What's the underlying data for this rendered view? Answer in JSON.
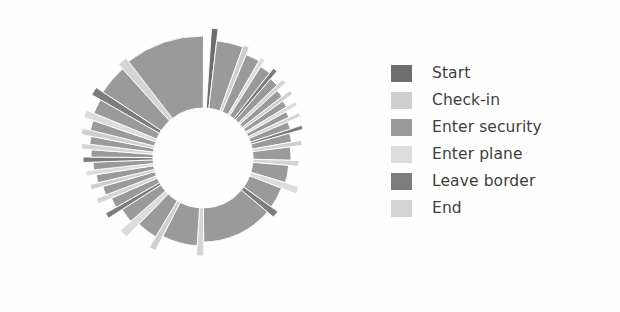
{
  "figure": {
    "background_color": "#fefefe",
    "title": ""
  },
  "legend": {
    "position": "right",
    "text_color": "#3f3f3f",
    "items": [
      {
        "label": "Start",
        "color": "#6e6e6e"
      },
      {
        "label": "Check-in",
        "color": "#cfcfcf"
      },
      {
        "label": "Enter security",
        "color": "#9a9a9a"
      },
      {
        "label": "Enter plane",
        "color": "#dcdcdc"
      },
      {
        "label": "Leave border",
        "color": "#7c7c7c"
      },
      {
        "label": "End",
        "color": "#d4d4d4"
      }
    ]
  },
  "chart_data": {
    "type": "pie",
    "subtype": "donut-radial-bar",
    "title": "",
    "xlabel": "",
    "ylabel": "",
    "grid": false,
    "legend_position": "right",
    "center_x": 203,
    "center_y": 158,
    "inner_radius": 50,
    "radius_range": [
      70,
      132
    ],
    "start_angle_deg": -88,
    "gap_deg": 3.5,
    "categories": [
      "Start",
      "Check-in",
      "Enter security",
      "Enter plane",
      "Leave border",
      "End"
    ],
    "category_colors": [
      "#6e6e6e",
      "#cfcfcf",
      "#9a9a9a",
      "#dcdcdc",
      "#7c7c7c",
      "#d4d4d4"
    ],
    "segments": [
      {
        "category": "Start",
        "angle_deg": 2.0,
        "radius": 130
      },
      {
        "category": "Enter security",
        "angle_deg": 9.0,
        "radius": 118
      },
      {
        "category": "Check-in",
        "angle_deg": 2.0,
        "radius": 120
      },
      {
        "category": "Enter security",
        "angle_deg": 5.0,
        "radius": 112
      },
      {
        "category": "Enter plane",
        "angle_deg": 1.6,
        "radius": 116
      },
      {
        "category": "Enter security",
        "angle_deg": 4.0,
        "radius": 108
      },
      {
        "category": "Leave border",
        "angle_deg": 1.6,
        "radius": 114
      },
      {
        "category": "Enter security",
        "angle_deg": 3.4,
        "radius": 104
      },
      {
        "category": "End",
        "angle_deg": 1.6,
        "radius": 112
      },
      {
        "category": "Enter security",
        "angle_deg": 3.0,
        "radius": 100
      },
      {
        "category": "Check-in",
        "angle_deg": 1.6,
        "radius": 110
      },
      {
        "category": "Enter security",
        "angle_deg": 2.8,
        "radius": 98
      },
      {
        "category": "Enter plane",
        "angle_deg": 1.6,
        "radius": 108
      },
      {
        "category": "Enter security",
        "angle_deg": 2.6,
        "radius": 95
      },
      {
        "category": "End",
        "angle_deg": 1.6,
        "radius": 106
      },
      {
        "category": "Enter security",
        "angle_deg": 3.2,
        "radius": 92
      },
      {
        "category": "Leave border",
        "angle_deg": 1.6,
        "radius": 104
      },
      {
        "category": "Enter security",
        "angle_deg": 4.0,
        "radius": 90
      },
      {
        "category": "Check-in",
        "angle_deg": 2.0,
        "radius": 100
      },
      {
        "category": "Enter security",
        "angle_deg": 6.0,
        "radius": 88
      },
      {
        "category": "End",
        "angle_deg": 2.4,
        "radius": 96
      },
      {
        "category": "Enter security",
        "angle_deg": 8.0,
        "radius": 86
      },
      {
        "category": "Enter plane",
        "angle_deg": 3.0,
        "radius": 100
      },
      {
        "category": "Enter security",
        "angle_deg": 10.0,
        "radius": 84
      },
      {
        "category": "Leave border",
        "angle_deg": 3.0,
        "radius": 92
      },
      {
        "category": "Enter security",
        "angle_deg": 34.0,
        "radius": 84
      },
      {
        "category": "End",
        "angle_deg": 3.0,
        "radius": 98
      },
      {
        "category": "Enter security",
        "angle_deg": 16.0,
        "radius": 88
      },
      {
        "category": "Check-in",
        "angle_deg": 2.6,
        "radius": 104
      },
      {
        "category": "Enter security",
        "angle_deg": 9.0,
        "radius": 92
      },
      {
        "category": "Enter plane",
        "angle_deg": 3.2,
        "radius": 110
      },
      {
        "category": "Enter security",
        "angle_deg": 6.0,
        "radius": 96
      },
      {
        "category": "Leave border",
        "angle_deg": 2.0,
        "radius": 112
      },
      {
        "category": "Enter security",
        "angle_deg": 4.0,
        "radius": 100
      },
      {
        "category": "End",
        "angle_deg": 2.0,
        "radius": 114
      },
      {
        "category": "Enter security",
        "angle_deg": 3.4,
        "radius": 104
      },
      {
        "category": "Check-in",
        "angle_deg": 1.8,
        "radius": 116
      },
      {
        "category": "Enter security",
        "angle_deg": 3.0,
        "radius": 108
      },
      {
        "category": "Enter plane",
        "angle_deg": 1.8,
        "radius": 118
      },
      {
        "category": "Enter security",
        "angle_deg": 2.8,
        "radius": 110
      },
      {
        "category": "Leave border",
        "angle_deg": 1.8,
        "radius": 120
      },
      {
        "category": "Enter security",
        "angle_deg": 2.6,
        "radius": 112
      },
      {
        "category": "End",
        "angle_deg": 1.8,
        "radius": 122
      },
      {
        "category": "Enter security",
        "angle_deg": 2.8,
        "radius": 114
      },
      {
        "category": "Check-in",
        "angle_deg": 2.0,
        "radius": 124
      },
      {
        "category": "Enter security",
        "angle_deg": 3.4,
        "radius": 116
      },
      {
        "category": "Enter plane",
        "angle_deg": 2.4,
        "radius": 126
      },
      {
        "category": "Enter security",
        "angle_deg": 5.0,
        "radius": 118
      },
      {
        "category": "Leave border",
        "angle_deg": 2.6,
        "radius": 128
      },
      {
        "category": "Enter security",
        "angle_deg": 10.0,
        "radius": 120
      },
      {
        "category": "End",
        "angle_deg": 3.0,
        "radius": 126
      },
      {
        "category": "Enter security",
        "angle_deg": 26.0,
        "radius": 122
      }
    ]
  }
}
